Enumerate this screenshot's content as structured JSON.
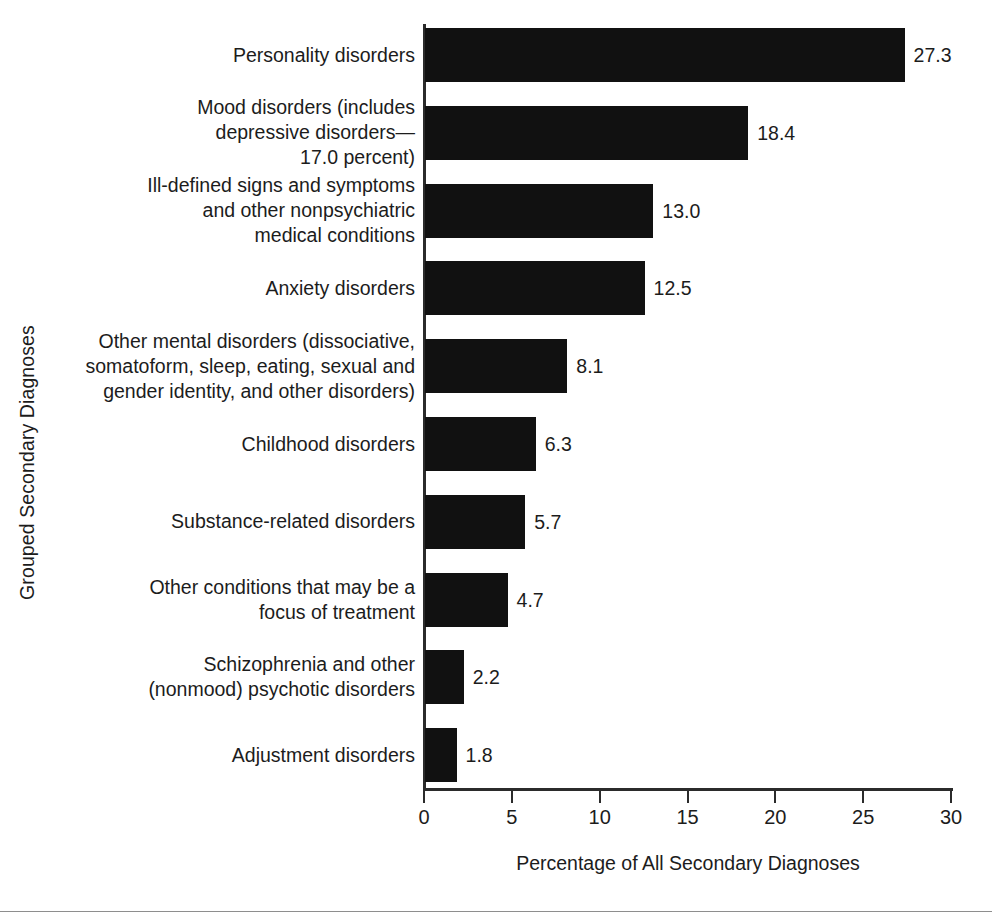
{
  "chart_data": {
    "type": "bar",
    "orientation": "horizontal",
    "title": "",
    "xlabel": "Percentage of All Secondary Diagnoses",
    "ylabel": "Grouped Secondary Diagnoses",
    "xlim": [
      0,
      30
    ],
    "xticks": [
      "0",
      "5",
      "10",
      "15",
      "20",
      "25",
      "30"
    ],
    "grid": false,
    "legend": null,
    "bar_color": "#111111",
    "axis_color": "#2b2b2b",
    "categories": [
      "Personality disorders",
      "Mood disorders (includes depressive disorders—17.0 percent)",
      "Ill-defined signs and symptoms and other nonpsychiatric medical conditions",
      "Anxiety disorders",
      "Other mental disorders (dissociative, somatoform, sleep, eating, sexual and gender identity, and other disorders)",
      "Childhood disorders",
      "Substance-related disorders",
      "Other conditions that may be a focus of treatment",
      "Schizophrenia and other (nonmood) psychotic disorders",
      "Adjustment disorders"
    ],
    "values": [
      27.3,
      18.4,
      13.0,
      12.5,
      8.1,
      6.3,
      5.7,
      4.7,
      2.2,
      1.8
    ],
    "value_labels": [
      "27.3",
      "18.4",
      "13.0",
      "12.5",
      "8.1",
      "6.3",
      "5.7",
      "4.7",
      "2.2",
      "1.8"
    ],
    "category_label_lines": [
      [
        "Personality disorders"
      ],
      [
        "Mood disorders (includes",
        "depressive disorders—",
        "17.0 percent)"
      ],
      [
        "Ill-defined signs and symptoms",
        "and other nonpsychiatric",
        "medical conditions"
      ],
      [
        "Anxiety disorders"
      ],
      [
        "Other mental disorders (dissociative,",
        "somatoform, sleep, eating, sexual and",
        "gender identity, and other disorders)"
      ],
      [
        "Childhood disorders"
      ],
      [
        "Substance-related disorders"
      ],
      [
        "Other conditions that may be a",
        "focus of treatment"
      ],
      [
        "Schizophrenia and other",
        "(nonmood) psychotic disorders"
      ],
      [
        "Adjustment disorders"
      ]
    ]
  }
}
